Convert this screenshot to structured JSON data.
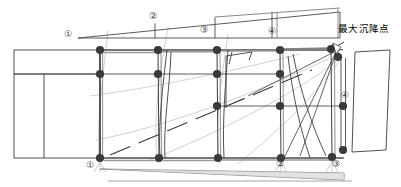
{
  "figure": {
    "kind": "engineering-settlement-diagram",
    "annotation_text": "最大沉降点",
    "circled_markers": {
      "top_wedge": [
        {
          "id": "top-1",
          "label": "①",
          "x": 68,
          "y": 34
        },
        {
          "id": "top-2",
          "label": "②",
          "x": 153,
          "y": 17
        },
        {
          "id": "top-3",
          "label": "③",
          "x": 204,
          "y": 30
        },
        {
          "id": "top-4",
          "label": "④",
          "x": 272,
          "y": 31
        }
      ],
      "bottom_axis": [
        {
          "id": "bot-1",
          "label": "①",
          "x": 90,
          "y": 165
        },
        {
          "id": "bot-2",
          "label": "②",
          "x": 280,
          "y": 164
        },
        {
          "id": "bot-3",
          "label": "③",
          "x": 336,
          "y": 164
        }
      ],
      "right_side": [
        {
          "id": "right-4",
          "label": "④",
          "x": 345,
          "y": 96
        }
      ]
    },
    "max_settlement_label": {
      "text": "最大沉降点",
      "x": 340,
      "y": 28
    },
    "colors": {
      "outline": "#3c3c3c",
      "grid_line": "#4a4a4a",
      "node_fill": "#3a3a3a",
      "faint_curve": "#cfcfcf",
      "mid_gray": "#9a9a9a",
      "thick_gray": "#8c8c8c",
      "background": "#ffffff",
      "dashed_diagonal": "#3a3a3a"
    },
    "nodes": {
      "radius": 4.1,
      "rows": [
        {
          "row": "top",
          "y": 50,
          "xs": [
            100,
            158,
            217,
            280,
            331
          ]
        },
        {
          "row": "upper-mid",
          "y": 74,
          "xs": [
            100,
            158,
            217,
            280
          ]
        },
        {
          "row": "lower-mid",
          "y": 106,
          "xs": [
            217,
            280,
            343
          ]
        },
        {
          "row": "bottom",
          "y": 158,
          "xs": [
            100,
            159,
            218,
            281,
            332
          ]
        }
      ],
      "extra": [
        {
          "x": 338,
          "y": 57
        },
        {
          "x": 343,
          "y": 148
        }
      ]
    },
    "columns": {
      "x_positions": [
        100,
        158,
        217,
        280,
        331
      ],
      "top_y": 50,
      "bottom_y": 158
    },
    "top_wedge": {
      "apex_x": 78,
      "apex_y": 38,
      "right_x": 340,
      "top_right_y": 12,
      "baseline_y": 38,
      "dividers_x": [
        155,
        215,
        272,
        277,
        338
      ]
    },
    "bottom_wedge": {
      "left_x": 100,
      "right_x": 343,
      "top_y": 170,
      "bottom_y": 180
    },
    "left_panel": {
      "x": 14,
      "y": 50,
      "width": 86,
      "height": 108,
      "inner_divider_y": 74,
      "inner_divider_x": 44
    },
    "right_panel": {
      "top_x": 355,
      "top_y": 52,
      "bottom_x": 352,
      "bottom_y": 152,
      "far_x": 390
    }
  }
}
